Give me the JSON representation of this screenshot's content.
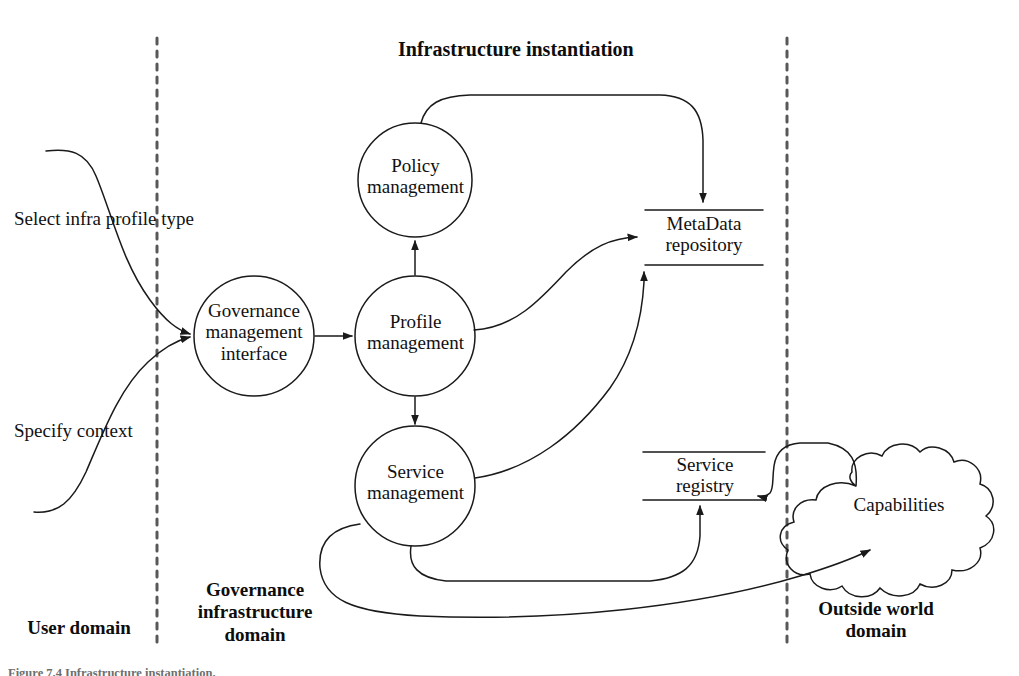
{
  "figure": {
    "title": "Infrastructure instantiation",
    "caption": "Figure 7.4 Infrastructure instantiation."
  },
  "domains": [
    {
      "id": "user-domain",
      "label": "User domain"
    },
    {
      "id": "governance-infrastructure-domain",
      "label": "Governance\ninfrastructure\ndomain"
    },
    {
      "id": "outside-world-domain",
      "label": "Outside world\ndomain"
    }
  ],
  "flows": [
    {
      "id": "select-infra-profile-type",
      "label": "Select  infra profile type"
    },
    {
      "id": "specify-context",
      "label": "Specify  context"
    }
  ],
  "processes": [
    {
      "id": "governance-management-interface",
      "label": "Governance\nmanagement\ninterface"
    },
    {
      "id": "policy-management",
      "label": "Policy\nmanagement"
    },
    {
      "id": "profile-management",
      "label": "Profile\nmanagement"
    },
    {
      "id": "service-management",
      "label": "Service\nmanagement"
    }
  ],
  "datastores": [
    {
      "id": "metadata-repository",
      "label": "MetaData\nrepository"
    },
    {
      "id": "service-registry",
      "label": "Service\nregistry"
    }
  ],
  "externals": [
    {
      "id": "capabilities",
      "label": "Capabilities"
    }
  ],
  "colors": {
    "stroke": "#1a1a1a",
    "dashed_divider": "#58585a",
    "background": "#ffffff",
    "text": "#111111",
    "caption": "#6e6e6e"
  }
}
